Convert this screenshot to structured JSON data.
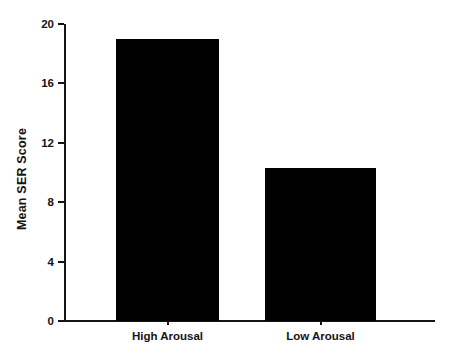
{
  "chart_data": {
    "type": "bar",
    "title": "",
    "xlabel": "",
    "ylabel": "Mean SER Score",
    "categories": [
      "High Arousal",
      "Low Arousal"
    ],
    "values": [
      19.0,
      10.3
    ],
    "ylim": [
      0,
      20
    ],
    "yticks": [
      0,
      4,
      8,
      12,
      16,
      20
    ],
    "ytick_labels": [
      "0",
      "4",
      "8",
      "12",
      "16",
      "20"
    ],
    "grid": false,
    "legend": false,
    "bar_color": "#010101",
    "axis_color": "#151515",
    "background_color": "#ffffff"
  },
  "figure": {
    "y_axis_title": "Mean SER Score"
  }
}
